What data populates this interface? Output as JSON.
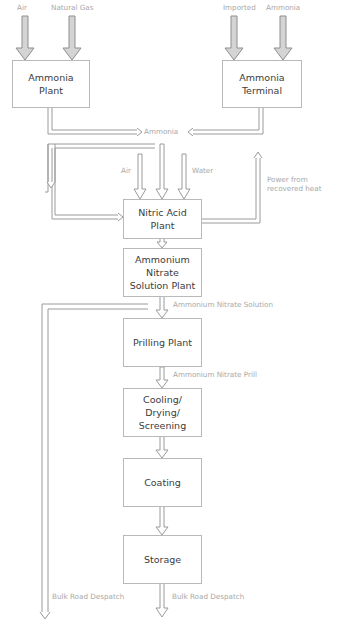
{
  "diagram": {
    "colors": {
      "pipe": "#9a9a9a",
      "box_border": "#b9b9b9",
      "box_text": "#3c3c3c",
      "label_text": "#a8a8a8",
      "arrow_fill": "#d8d8d8"
    },
    "inputs": {
      "ammonia_plant": [
        "Air",
        "Natural Gas"
      ],
      "ammonia_terminal": [
        "Imported",
        "Ammonia"
      ],
      "nitric_acid": [
        "Air",
        "Water"
      ]
    },
    "nodes": [
      {
        "id": "ammonia_plant",
        "label": "Ammonia\nPlant"
      },
      {
        "id": "ammonia_terminal",
        "label": "Ammonia\nTerminal"
      },
      {
        "id": "nitric_acid_plant",
        "label": "Nitric Acid\nPlant"
      },
      {
        "id": "an_solution_plant",
        "label": "Ammonium\nNitrate\nSolution Plant"
      },
      {
        "id": "prilling_plant",
        "label": "Prilling Plant"
      },
      {
        "id": "cooling",
        "label": "Cooling/\nDrying/\nScreening"
      },
      {
        "id": "coating",
        "label": "Coating"
      },
      {
        "id": "storage",
        "label": "Storage"
      }
    ],
    "flow_labels": {
      "ammonia": "Ammonia",
      "power": "Power from\nrecovered heat",
      "an_solution": "Ammonium Nitrate Solution",
      "an_prill": "Ammonium Nitrate Prill",
      "bulk_left": "Bulk Road Despatch",
      "bulk_right": "Bulk Road Despatch"
    },
    "edges": [
      {
        "from": "Air",
        "to": "ammonia_plant"
      },
      {
        "from": "Natural Gas",
        "to": "ammonia_plant"
      },
      {
        "from": "Imported Ammonia",
        "to": "ammonia_terminal"
      },
      {
        "from": "ammonia_plant",
        "to": "Ammonia"
      },
      {
        "from": "ammonia_terminal",
        "to": "Ammonia"
      },
      {
        "from": "Ammonia",
        "to": "nitric_acid_plant"
      },
      {
        "from": "Ammonia",
        "to": "an_solution_plant"
      },
      {
        "from": "Air",
        "to": "nitric_acid_plant"
      },
      {
        "from": "Water",
        "to": "nitric_acid_plant"
      },
      {
        "from": "nitric_acid_plant",
        "to": "Power from recovered heat"
      },
      {
        "from": "nitric_acid_plant",
        "to": "an_solution_plant"
      },
      {
        "from": "an_solution_plant",
        "to": "prilling_plant",
        "label": "Ammonium Nitrate Solution"
      },
      {
        "from": "an_solution_plant",
        "to": "Bulk Road Despatch"
      },
      {
        "from": "prilling_plant",
        "to": "cooling",
        "label": "Ammonium Nitrate Prill"
      },
      {
        "from": "cooling",
        "to": "coating"
      },
      {
        "from": "coating",
        "to": "storage"
      },
      {
        "from": "storage",
        "to": "Bulk Road Despatch"
      }
    ]
  }
}
